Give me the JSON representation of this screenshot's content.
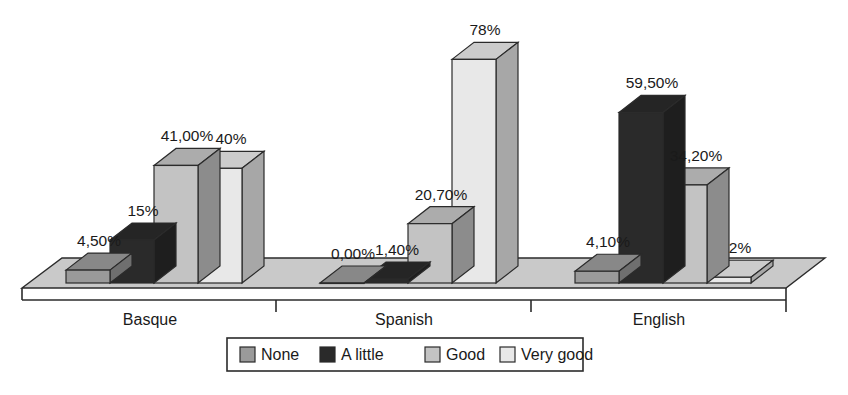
{
  "chart_data": {
    "type": "bar",
    "title": "",
    "subtitle": "",
    "xlabel": "",
    "ylabel": "",
    "ylim": [
      0,
      90
    ],
    "grid": false,
    "legend_position": "bottom",
    "style": "3d-clustered-bar",
    "categories": [
      "Basque",
      "Spanish",
      "English"
    ],
    "series": [
      {
        "name": "None",
        "color": "#9a9a9a",
        "values": [
          4.5,
          0.0,
          4.1
        ],
        "labels": [
          "4,50%",
          "0,00%",
          "4,10%"
        ]
      },
      {
        "name": "A little",
        "color": "#2a2a2a",
        "values": [
          15.0,
          1.4,
          59.5
        ],
        "labels": [
          "15%",
          "1,40%",
          "59,50%"
        ]
      },
      {
        "name": "Good",
        "color": "#c3c3c3",
        "values": [
          41.0,
          20.7,
          34.2
        ],
        "labels": [
          "41,00%",
          "20,70%",
          "34,20%"
        ]
      },
      {
        "name": "Very good",
        "color": "#e8e8e8",
        "values": [
          40.0,
          78.0,
          2.0
        ],
        "labels": [
          "40%",
          "78%",
          "2%"
        ]
      }
    ]
  },
  "legend": {
    "items": [
      {
        "label": "None",
        "color": "#9a9a9a"
      },
      {
        "label": "A little",
        "color": "#2a2a2a"
      },
      {
        "label": "Good",
        "color": "#c3c3c3"
      },
      {
        "label": "Very good",
        "color": "#e8e8e8"
      }
    ]
  },
  "axis": {
    "category_labels": [
      "Basque",
      "Spanish",
      "English"
    ]
  },
  "colors": {
    "floor": "#c9c9c9",
    "outline": "#2b2b2b",
    "background": "#ffffff",
    "text": "#1a1a1a"
  }
}
